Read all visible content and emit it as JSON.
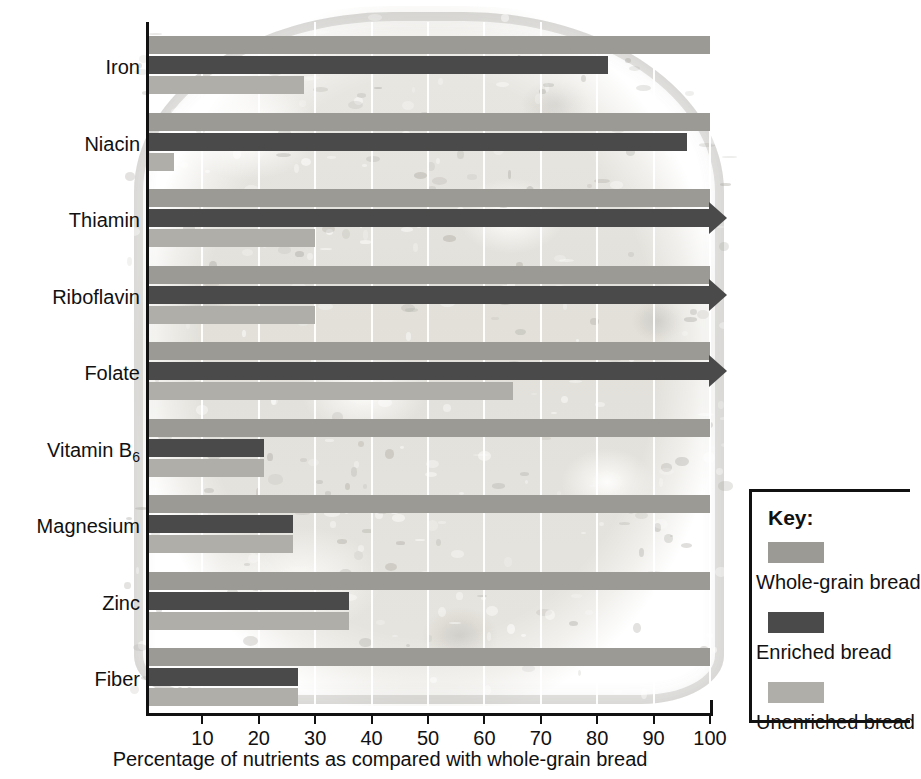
{
  "chart_data": {
    "type": "bar",
    "orientation": "horizontal",
    "title": "",
    "xlabel": "Percentage of nutrients as compared with whole-grain bread",
    "ylabel": "",
    "xlim": [
      0,
      100
    ],
    "xticks": [
      10,
      20,
      30,
      40,
      50,
      60,
      70,
      80,
      90,
      100
    ],
    "grid": true,
    "legend_position": "right",
    "categories": [
      "Iron",
      "Niacin",
      "Thiamin",
      "Riboflavin",
      "Folate",
      "Vitamin B6",
      "Magnesium",
      "Zinc",
      "Fiber"
    ],
    "category_labels_html": [
      "Iron",
      "Niacin",
      "Thiamin",
      "Riboflavin",
      "Folate",
      "Vitamin B<sub>6</sub>",
      "Magnesium",
      "Zinc",
      "Fiber"
    ],
    "series": [
      {
        "name": "Whole-grain bread",
        "color": "#9c9a95",
        "values": [
          100,
          100,
          100,
          100,
          100,
          100,
          100,
          100,
          100
        ],
        "overflow": [
          false,
          false,
          false,
          false,
          false,
          false,
          false,
          false,
          false
        ]
      },
      {
        "name": "Enriched bread",
        "color": "#4a4a4a",
        "values": [
          82,
          96,
          100,
          100,
          100,
          21,
          26,
          36,
          27
        ],
        "overflow": [
          false,
          false,
          true,
          true,
          true,
          false,
          false,
          false,
          false
        ]
      },
      {
        "name": "Unenriched bread",
        "color": "#b0aea9",
        "values": [
          28,
          5,
          30,
          30,
          65,
          21,
          26,
          36,
          27
        ],
        "overflow": [
          false,
          false,
          false,
          false,
          false,
          false,
          false,
          false,
          false
        ]
      }
    ]
  },
  "axis": {
    "tick_labels": [
      "10",
      "20",
      "30",
      "40",
      "50",
      "60",
      "70",
      "80",
      "90",
      "100"
    ],
    "x_title": "Percentage of nutrients as compared with whole-grain bread"
  },
  "legend": {
    "title": "Key:",
    "items": [
      {
        "label": "Whole-grain bread",
        "color": "#9c9a95"
      },
      {
        "label": "Enriched bread",
        "color": "#4a4a4a"
      },
      {
        "label": "Unenriched bread",
        "color": "#b0aea9"
      }
    ]
  }
}
